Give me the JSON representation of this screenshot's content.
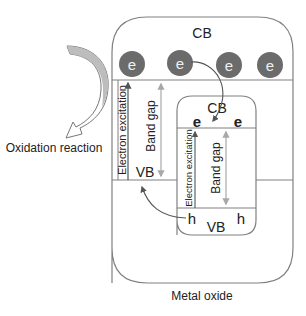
{
  "diagram": {
    "outer": {
      "cb_label": "CB",
      "vb_label": "VB",
      "electron_label": "e",
      "excitation_label": "Electron excitation",
      "band_gap_label": "Band gap",
      "caption": "Metal oxide",
      "electron_count": 4
    },
    "inner": {
      "cb_label": "CB",
      "vb_label": "VB",
      "electron_labels": [
        "e",
        "e"
      ],
      "hole_labels": [
        "h",
        "h"
      ],
      "excitation_label": "Electron excitation",
      "band_gap_label": "Band gap"
    },
    "reaction_label": "Oxidation reaction",
    "colors": {
      "outline": "#808080",
      "electron_fill": "#6b6b6b",
      "electron_text": "#f0f0f0",
      "arrow_dark": "#555555",
      "arrow_gray": "#a8a8a8",
      "band_arrow_fill": "#c8c8c8",
      "text": "#222222"
    }
  }
}
